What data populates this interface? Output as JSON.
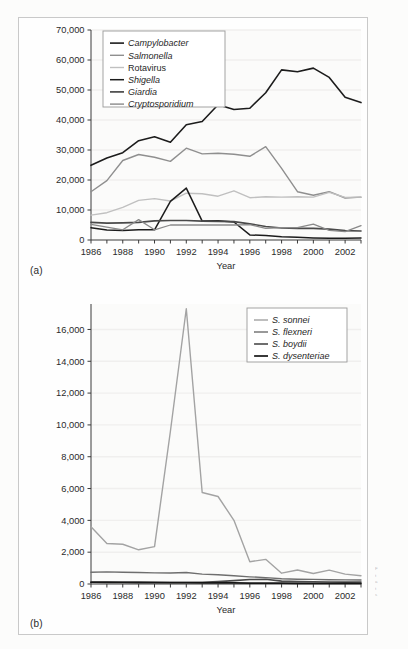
{
  "figure": {
    "panel_a_tag": "(a)",
    "panel_b_tag": "(b)",
    "edge_caption_lines": [
      "F",
      "t",
      "a",
      "t",
      "s"
    ]
  },
  "chart_data": [
    {
      "id": "panel-a",
      "type": "line",
      "title": "",
      "xlabel": "Year",
      "ylabel": "",
      "xlim": [
        1986,
        2003
      ],
      "ylim": [
        0,
        70000
      ],
      "yticks": [
        "0",
        "10,000",
        "20,000",
        "30,000",
        "40,000",
        "50,000",
        "60,000",
        "70,000"
      ],
      "ytick_values": [
        0,
        10000,
        20000,
        30000,
        40000,
        50000,
        60000,
        70000
      ],
      "xticks_major": [
        "1986",
        "1988",
        "1990",
        "1992",
        "1994",
        "1996",
        "1998",
        "2000",
        "2002"
      ],
      "xtick_values_major": [
        1986,
        1988,
        1990,
        1992,
        1994,
        1996,
        1998,
        2000,
        2002
      ],
      "x": [
        1986,
        1987,
        1988,
        1989,
        1990,
        1991,
        1992,
        1993,
        1994,
        1995,
        1996,
        1997,
        1998,
        1999,
        2000,
        2001,
        2002,
        2003
      ],
      "grid": false,
      "legend_position": "top-left",
      "series": [
        {
          "name": "Campylobacter",
          "italic": true,
          "color": "#1c1c1c",
          "width": 1.6,
          "values": [
            24900,
            27300,
            29100,
            33100,
            34400,
            32600,
            38400,
            39500,
            45100,
            43500,
            43900,
            49100,
            56700,
            56100,
            57300,
            54200,
            47600,
            45800
          ]
        },
        {
          "name": "Salmonella",
          "italic": true,
          "color": "#8f8f8f",
          "width": 1.4,
          "values": [
            16100,
            19800,
            26500,
            28500,
            27600,
            26200,
            30600,
            28700,
            28900,
            28600,
            27900,
            31100,
            23900,
            16100,
            14900,
            16100,
            14000,
            14300
          ]
        },
        {
          "name": "Rotavirus",
          "italic": false,
          "color": "#c0c0c0",
          "width": 1.4,
          "values": [
            8300,
            9100,
            10900,
            13200,
            13800,
            13000,
            15600,
            15400,
            14600,
            16400,
            14100,
            14400,
            14300,
            14400,
            14300,
            15900,
            14200,
            14300
          ]
        },
        {
          "name": "Shigella",
          "italic": true,
          "color": "#1c1c1c",
          "width": 1.5,
          "values": [
            4100,
            3300,
            3200,
            3400,
            3400,
            12900,
            17300,
            6300,
            6400,
            6000,
            1700,
            1500,
            1100,
            900,
            700,
            600,
            600,
            700
          ]
        },
        {
          "name": "Giardia",
          "italic": true,
          "color": "#4a4a4a",
          "width": 1.7,
          "values": [
            5900,
            5600,
            5700,
            5900,
            6400,
            6500,
            6500,
            6300,
            6200,
            6100,
            5400,
            4500,
            4000,
            3900,
            3900,
            3600,
            3100,
            3000
          ]
        },
        {
          "name": "Cryptosporidium",
          "italic": true,
          "color": "#8a8a8a",
          "width": 1.3,
          "values": [
            5200,
            4300,
            3400,
            6800,
            3400,
            5000,
            5000,
            5000,
            5000,
            5000,
            5100,
            3900,
            4100,
            4100,
            5300,
            3200,
            2800,
            4800
          ]
        }
      ]
    },
    {
      "id": "panel-b",
      "type": "line",
      "title": "",
      "xlabel": "Year",
      "ylabel": "",
      "xlim": [
        1986,
        2003
      ],
      "ylim": [
        0,
        17600
      ],
      "yticks": [
        "0",
        "2,000",
        "4,000",
        "6,000",
        "8,000",
        "10,000",
        "12,000",
        "14,000",
        "16,000"
      ],
      "ytick_values": [
        0,
        2000,
        4000,
        6000,
        8000,
        10000,
        12000,
        14000,
        16000
      ],
      "xticks_major": [
        "1986",
        "1988",
        "1990",
        "1992",
        "1994",
        "1996",
        "1998",
        "2000",
        "2002"
      ],
      "xtick_values_major": [
        1986,
        1988,
        1990,
        1992,
        1994,
        1996,
        1998,
        2000,
        2002
      ],
      "x": [
        1986,
        1987,
        1988,
        1989,
        1990,
        1991,
        1992,
        1993,
        1994,
        1995,
        1996,
        1997,
        1998,
        1999,
        2000,
        2001,
        2002,
        2003
      ],
      "grid": false,
      "legend_position": "top-right",
      "series": [
        {
          "name": "S. sonnei",
          "italic": true,
          "color": "#a3a3a3",
          "width": 1.4,
          "values": [
            3600,
            2550,
            2500,
            2150,
            2350,
            9600,
            17300,
            5750,
            5500,
            4000,
            1400,
            1550,
            680,
            880,
            660,
            870,
            620,
            520
          ]
        },
        {
          "name": "S. flexneri",
          "italic": true,
          "color": "#6e6e6e",
          "width": 1.4,
          "values": [
            740,
            760,
            740,
            720,
            700,
            690,
            720,
            620,
            580,
            520,
            450,
            400,
            330,
            300,
            290,
            270,
            260,
            250
          ]
        },
        {
          "name": "S. boydii",
          "italic": true,
          "color": "#4a4a4a",
          "width": 1.6,
          "values": [
            130,
            120,
            120,
            115,
            110,
            105,
            105,
            110,
            150,
            210,
            280,
            300,
            180,
            150,
            140,
            130,
            120,
            115
          ]
        },
        {
          "name": "S. dysenteriae",
          "italic": true,
          "color": "#161616",
          "width": 1.7,
          "values": [
            110,
            100,
            95,
            90,
            85,
            80,
            80,
            75,
            70,
            65,
            60,
            55,
            50,
            45,
            40,
            38,
            35,
            30
          ]
        }
      ]
    }
  ]
}
